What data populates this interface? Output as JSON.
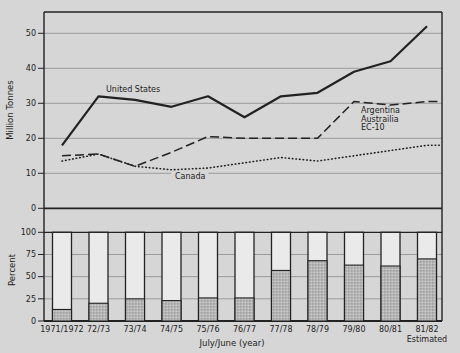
{
  "figure": {
    "background": "#d6d6d6",
    "ink": "#222222",
    "grid_color": "#9b9b9b",
    "bar_fill": "#eaeaea",
    "shade_base": "#b6b6b6",
    "shade_dot_dark": "#8f8f8f",
    "shade_dot_light": "#d2d2d2"
  },
  "categories": [
    "1971/1972",
    "72/73",
    "73/74",
    "74/75",
    "75/76",
    "76/77",
    "77/78",
    "78/79",
    "79/80",
    "80/81",
    "81/82"
  ],
  "xaxis": {
    "title": "July/June (year)",
    "last_category_note": "Estimated"
  },
  "chart_data": [
    {
      "type": "line",
      "panel": "top",
      "ylabel": "Million Tonnes",
      "ylim": [
        0,
        56
      ],
      "yticks": [
        0,
        10,
        20,
        30,
        40,
        50
      ],
      "grid": true,
      "legend": "inline-labels",
      "categories": [
        "1971/1972",
        "72/73",
        "73/74",
        "74/75",
        "75/76",
        "76/77",
        "77/78",
        "78/79",
        "79/80",
        "80/81",
        "81/82"
      ],
      "series": [
        {
          "name": "United States",
          "line_style": "solid",
          "extend_to_edge": false,
          "values": [
            18,
            32,
            31,
            29,
            32,
            26,
            32,
            33,
            39,
            42,
            52
          ]
        },
        {
          "name": "Argentina Austrailia EC-10",
          "line_style": "dashed",
          "extend_to_edge": true,
          "values": [
            15,
            15.5,
            12,
            16,
            20.5,
            20,
            20,
            20,
            30.5,
            29.5,
            30.5
          ]
        },
        {
          "name": "Canada",
          "line_style": "dotted",
          "extend_to_edge": true,
          "values": [
            13.5,
            15.5,
            12,
            11,
            11.5,
            13,
            14.5,
            13.5,
            15,
            16.5,
            18
          ]
        }
      ],
      "labels": [
        {
          "text_lines": [
            "United States"
          ],
          "x": 106,
          "y": 92,
          "masked": false
        },
        {
          "text_lines": [
            "Argentina",
            "Austrailia",
            "EC-10"
          ],
          "x": 361,
          "y": 113,
          "masked": false
        },
        {
          "text_lines": [
            "Canada"
          ],
          "x": 175,
          "y": 179,
          "masked": true
        }
      ]
    },
    {
      "type": "bar",
      "panel": "bottom",
      "ylabel": "Percent",
      "ylim": [
        0,
        100
      ],
      "yticks": [
        0,
        25,
        50,
        75,
        100
      ],
      "grid": true,
      "bar_outline_to": 100,
      "categories": [
        "1971/1972",
        "72/73",
        "73/74",
        "74/75",
        "75/76",
        "76/77",
        "77/78",
        "78/79",
        "79/80",
        "80/81",
        "81/82"
      ],
      "values": [
        13,
        20,
        25,
        23,
        26,
        26,
        57,
        68,
        63,
        62,
        70
      ]
    }
  ]
}
